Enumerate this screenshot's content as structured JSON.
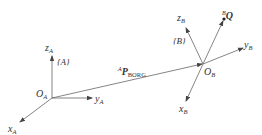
{
  "diagram": {
    "frame_a": {
      "name": "{A}",
      "origin_label": "O",
      "origin_sub": "A",
      "x_label": "x",
      "x_sub": "A",
      "y_label": "y",
      "y_sub": "A",
      "z_label": "z",
      "z_sub": "A"
    },
    "frame_b": {
      "name": "{B}",
      "origin_label": "O",
      "origin_sub": "B",
      "x_label": "x",
      "x_sub": "B",
      "y_label": "y",
      "y_sub": "B",
      "z_label": "z",
      "z_sub": "B"
    },
    "vector": {
      "pre_sup": "A",
      "symbol": "P",
      "sub": "BORG"
    },
    "point": {
      "pre_sup": "B",
      "symbol": "Q"
    },
    "colors": {
      "line": "#555555",
      "text": "#333333"
    }
  }
}
